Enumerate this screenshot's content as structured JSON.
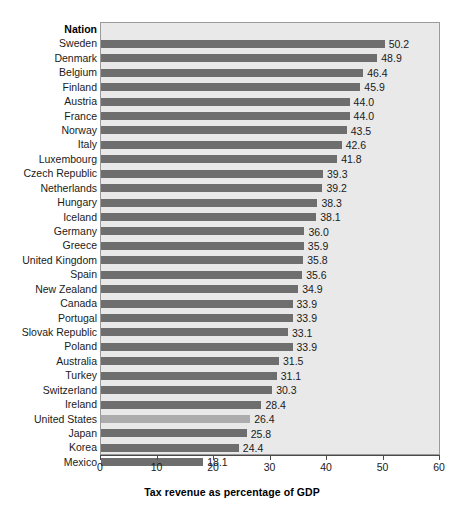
{
  "chart_data": {
    "type": "bar",
    "orientation": "horizontal",
    "title": "",
    "xlabel": "Tax revenue as percentage of GDP",
    "ylabel": "Nation",
    "xlim": [
      0,
      60
    ],
    "xticks": [
      0,
      10,
      20,
      30,
      40,
      50,
      60
    ],
    "grid": false,
    "legend": "none",
    "category_header": "Nation",
    "categories": [
      "Sweden",
      "Denmark",
      "Belgium",
      "Finland",
      "Austria",
      "France",
      "Norway",
      "Italy",
      "Luxembourg",
      "Czech Republic",
      "Netherlands",
      "Hungary",
      "Iceland",
      "Germany",
      "Greece",
      "United Kingdom",
      "Spain",
      "New Zealand",
      "Canada",
      "Portugal",
      "Slovak Republic",
      "Poland",
      "Australia",
      "Turkey",
      "Switzerland",
      "Ireland",
      "United States",
      "Japan",
      "Korea",
      "Mexico"
    ],
    "values": [
      50.2,
      48.9,
      46.4,
      45.9,
      44.0,
      44.0,
      43.5,
      42.6,
      41.8,
      39.3,
      39.2,
      38.3,
      38.1,
      36.0,
      35.9,
      35.8,
      35.6,
      34.9,
      33.9,
      33.9,
      33.1,
      33.9,
      31.5,
      31.1,
      30.3,
      28.4,
      26.4,
      25.8,
      24.4,
      18.1
    ],
    "value_labels": [
      "50.2",
      "48.9",
      "46.4",
      "45.9",
      "44.0",
      "44.0",
      "43.5",
      "42.6",
      "41.8",
      "39.3",
      "39.2",
      "38.3",
      "38.1",
      "36.0",
      "35.9",
      "35.8",
      "35.6",
      "34.9",
      "33.9",
      "33.9",
      "33.1",
      "33.9",
      "31.5",
      "31.1",
      "30.3",
      "28.4",
      "26.4",
      "25.8",
      "24.4",
      "18.1"
    ],
    "highlighted_category": "United States",
    "colors": {
      "bar": "#6e6e6e",
      "bar_highlight": "#acacac",
      "plot_background": "#e9e9e9",
      "plot_border": "#9a9a9a",
      "text": "#1a1a1a",
      "axis": "#4a4a4a",
      "page_background": "#ffffff"
    }
  }
}
